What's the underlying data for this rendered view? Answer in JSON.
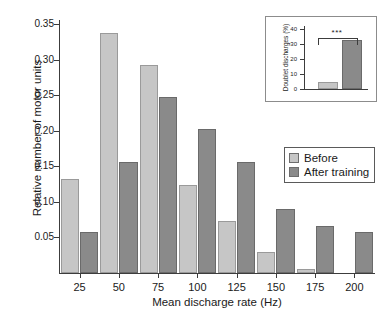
{
  "chart_data": [
    {
      "id": "main",
      "type": "bar",
      "title": "",
      "xlabel": "Mean discharge rate (Hz)",
      "ylabel": "Relative number of motor units",
      "categories": [
        "25",
        "50",
        "75",
        "100",
        "125",
        "150",
        "175",
        "200"
      ],
      "series": [
        {
          "name": "Before",
          "color": "#c6c6c6",
          "values": [
            0.132,
            0.338,
            0.293,
            0.124,
            0.073,
            0.03,
            0.005,
            0.0
          ]
        },
        {
          "name": "After training",
          "color": "#8a8a8a",
          "values": [
            0.058,
            0.156,
            0.247,
            0.202,
            0.156,
            0.09,
            0.066,
            0.058
          ]
        }
      ],
      "ylim": [
        0,
        0.36
      ],
      "yticks": [
        "0.05",
        "0.10",
        "0.15",
        "0.20",
        "0.25",
        "0.30",
        "0.35"
      ],
      "ytick_values": [
        0.05,
        0.1,
        0.15,
        0.2,
        0.25,
        0.3,
        0.35
      ],
      "grid": false,
      "legend_position": "right"
    },
    {
      "id": "inset",
      "type": "bar",
      "title": "",
      "xlabel": "",
      "ylabel": "Doublet discharges (%)",
      "categories": [
        "Before",
        "After training"
      ],
      "values": [
        5,
        33
      ],
      "colors": [
        "#c6c6c6",
        "#8a8a8a"
      ],
      "ylim": [
        0,
        42
      ],
      "yticks": [
        "0",
        "10",
        "20",
        "30",
        "40"
      ],
      "ytick_values": [
        0,
        10,
        20,
        30,
        40
      ],
      "annotation": "***",
      "grid": false
    }
  ],
  "legend": {
    "items": [
      {
        "label": "Before",
        "color": "#c6c6c6"
      },
      {
        "label": "After training",
        "color": "#8a8a8a"
      }
    ]
  }
}
